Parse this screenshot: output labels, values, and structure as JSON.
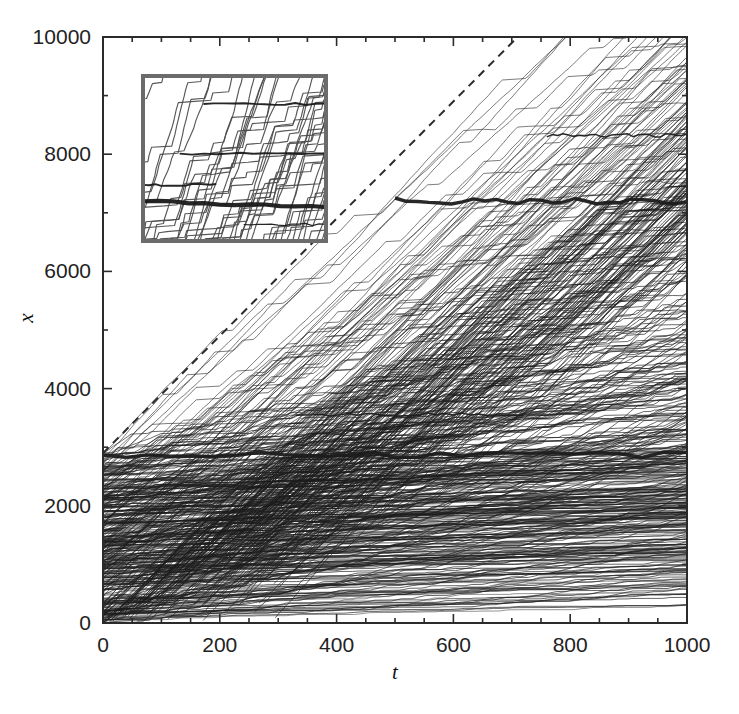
{
  "figure": {
    "background_color": "#ffffff",
    "line_color": "#1c1c1c",
    "frame_color": "#2b2b2b",
    "dashed_line_color": "#2b2b2b",
    "inset_border_color": "#6b6b6b"
  },
  "chart_data": {
    "type": "line",
    "title": "",
    "subtitle": "",
    "xlabel": "t",
    "ylabel": "x",
    "xlim": [
      0,
      1000
    ],
    "ylim": [
      0,
      10000
    ],
    "xticks": [
      0,
      200,
      400,
      600,
      800,
      1000
    ],
    "yticks": [
      0,
      2000,
      4000,
      6000,
      8000,
      10000
    ],
    "xtick_labels": [
      "0",
      "200",
      "400",
      "600",
      "800",
      "1000"
    ],
    "ytick_labels": [
      "0",
      "2000",
      "4000",
      "6000",
      "8000",
      "10000"
    ],
    "x_minor_step": 50,
    "y_minor_step": 1000,
    "grid": false,
    "legend": null,
    "legend_position": "none",
    "annotations": [
      {
        "name": "dashed-reference-line",
        "kind": "line",
        "style": "dashed",
        "x0": 0,
        "y0": 2900,
        "x1": 710,
        "y1": 10000,
        "slope": 10.0
      },
      {
        "name": "major-plateau-upper",
        "kind": "horizontal-band",
        "x_start": 500,
        "x_end": 1000,
        "y": 7200,
        "emphasis": "thick"
      },
      {
        "name": "major-plateau-lower",
        "kind": "horizontal-band",
        "x_start": 0,
        "x_end": 1000,
        "y": 2870,
        "emphasis": "thick"
      },
      {
        "name": "plateau-mid",
        "kind": "horizontal-band",
        "x_start": 330,
        "x_end": 720,
        "y": 3560,
        "emphasis": "thin"
      },
      {
        "name": "plateau-upper-right",
        "kind": "horizontal-band",
        "x_start": 760,
        "x_end": 1000,
        "y": 8320,
        "emphasis": "thin"
      }
    ],
    "series": [
      {
        "name": "bundle-lower-dense",
        "x0": 0,
        "y0_range": [
          0,
          2900
        ],
        "mean_slope": 7.2,
        "count": 160,
        "note": "dense congested bundle, many plateaux, spans full width, upper envelope rises from 2900 to about 2500-2900"
      },
      {
        "name": "bundle-free-flow",
        "x0_range": [
          0,
          300
        ],
        "mean_slope": 9.6,
        "count": 120,
        "note": "free-flowing fan rising to the top-right corner, slopes between 8 and 10"
      }
    ],
    "envelope": {
      "free_flow_leading_edge": [
        [
          0,
          0
        ],
        [
          100,
          980
        ],
        [
          300,
          2900
        ],
        [
          520,
          7100
        ],
        [
          560,
          7250
        ],
        [
          700,
          8900
        ],
        [
          1000,
          10000
        ]
      ],
      "congested_trailing_edge": [
        [
          0,
          0
        ],
        [
          120,
          400
        ],
        [
          260,
          1200
        ],
        [
          430,
          1750
        ],
        [
          620,
          2050
        ],
        [
          820,
          2250
        ],
        [
          1000,
          2400
        ]
      ]
    }
  },
  "inset": {
    "name": "magnified-inset",
    "border_color": "#6b6b6b",
    "border_width_px": 4,
    "position_px": {
      "x": 141,
      "y": 74,
      "width": 187,
      "height": 169
    },
    "description": "Magnified view of a small space-time window showing individual world-lines climbing steeply and then pinning onto near-horizontal jam lines; one very thick dark jam line runs across the lower third.",
    "content": {
      "steep_line_count": 46,
      "steep_slope_mean": 3.4,
      "jam_lines": [
        {
          "y_frac": 0.17,
          "x_start_frac": 0.33,
          "x_end_frac": 1.0,
          "weight": "medium"
        },
        {
          "y_frac": 0.47,
          "x_start_frac": 0.2,
          "x_end_frac": 1.0,
          "weight": "medium"
        },
        {
          "y_frac": 0.66,
          "x_start_frac": 0.0,
          "x_end_frac": 0.4,
          "weight": "medium"
        },
        {
          "y_frac": 0.76,
          "x_start_frac": 0.0,
          "x_end_frac": 1.0,
          "weight": "heavy"
        },
        {
          "y_frac": 0.9,
          "x_start_frac": 0.55,
          "x_end_frac": 1.0,
          "weight": "thin"
        }
      ]
    }
  },
  "axes_geometry_px": {
    "left": 103,
    "right": 687,
    "top": 37,
    "bottom": 623,
    "major_tick_len": 9,
    "minor_tick_len": 5,
    "frame_width": 2
  }
}
